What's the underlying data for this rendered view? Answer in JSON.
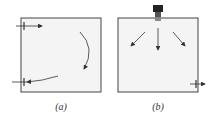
{
  "panels": [
    {
      "label": "(a)",
      "description": "Room with wall-mounted inlet and outlet at the left; curved airflow arrows"
    },
    {
      "label": "(b)",
      "description": "Room with ceiling diffuser at top center spreading air downward; outlet at lower right"
    }
  ],
  "colors": {
    "box_fill": "#f4f4f4",
    "stroke": "#333333"
  }
}
